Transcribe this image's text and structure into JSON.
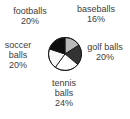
{
  "chart_data": {
    "type": "pie",
    "direction": "clockwise",
    "start_angle_deg": 0,
    "outline_color": "#1a1a1a",
    "slices": [
      {
        "label": "baseballs",
        "pct": 16,
        "color": "#b9b9b9"
      },
      {
        "label": "golf balls",
        "pct": 20,
        "color": "#333333"
      },
      {
        "label": "tennis balls",
        "pct": 24,
        "color": "#ffffff"
      },
      {
        "label": "soccer balls",
        "pct": 20,
        "color": "#f7f7f7"
      },
      {
        "label": "footballs",
        "pct": 20,
        "color": "#0e0e0e"
      }
    ],
    "legend_position": "around-chart",
    "grid": false
  },
  "labels": [
    {
      "name": "footballs",
      "lines": [
        "footballs",
        "20%"
      ]
    },
    {
      "name": "baseballs",
      "lines": [
        "baseballs",
        "16%"
      ]
    },
    {
      "name": "soccer-balls",
      "lines": [
        "soccer",
        "balls",
        "20%"
      ]
    },
    {
      "name": "golf-balls",
      "lines": [
        "golf balls",
        "20%"
      ]
    },
    {
      "name": "tennis-balls",
      "lines": [
        "tennis",
        "balls",
        "24%"
      ]
    }
  ],
  "text_color": "#3d3d3d"
}
